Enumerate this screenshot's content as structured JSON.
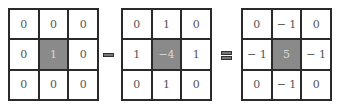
{
  "diagram": {
    "matrices": [
      {
        "name": "identity",
        "cells": [
          "0",
          "0",
          "0",
          "0",
          "1",
          "0",
          "0",
          "0",
          "0"
        ]
      },
      {
        "name": "laplacian",
        "cells": [
          "0",
          "1",
          "0",
          "1",
          "−4",
          "1",
          "0",
          "1",
          "0"
        ]
      },
      {
        "name": "sharpen",
        "cells": [
          "0",
          "− 1",
          "0",
          "− 1",
          "5",
          "− 1",
          "0",
          "− 1",
          "0"
        ]
      }
    ],
    "operators": [
      "minus",
      "equals"
    ],
    "colors": {
      "center_fill": "#8a8a8a",
      "border": "#2a2a2a",
      "operator": "#777777"
    }
  }
}
